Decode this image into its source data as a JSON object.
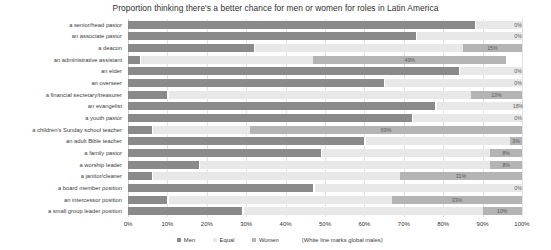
{
  "chart_data": {
    "type": "bar",
    "title": "Proportion thinking there's a better chance for men or women for roles in Latin America",
    "xlabel": "",
    "ylabel": "",
    "xlim": [
      0,
      100
    ],
    "grid": true,
    "stacked": true,
    "orientation": "horizontal",
    "legend_position": "bottom",
    "xticks": [
      "0%",
      "10%",
      "20%",
      "30%",
      "40%",
      "50%",
      "60%",
      "70%",
      "80%",
      "90%",
      "100%"
    ],
    "xtick_values": [
      0,
      10,
      20,
      30,
      40,
      50,
      60,
      70,
      80,
      90,
      100
    ],
    "legend": [
      {
        "name": "Men",
        "color": "#8a8a8a"
      },
      {
        "name": "Equal",
        "color": "#e8e8e8"
      },
      {
        "name": "Women",
        "color": "#b4b4b4"
      }
    ],
    "legend_note": "(White line marks global males)",
    "categories": [
      "a senior/head pastor",
      "an associate pastor",
      "a deacon",
      "an administrative assistant",
      "an elder",
      "an overseer",
      "a financial secretary/treasurer",
      "an evangelist",
      "a youth pastor",
      "a children's Sunday school teacher",
      "an adult Bible teacher",
      "a family pastor",
      "a worship leader",
      "a janitor/cleaner",
      "a board member position",
      "an intercessor position",
      "a small group leader position"
    ],
    "series": [
      {
        "name": "Men",
        "color": "#8a8a8a",
        "values": [
          88,
          73,
          32,
          3,
          84,
          65,
          10,
          78,
          72,
          6,
          60,
          49,
          18,
          6,
          47,
          10,
          29
        ]
      },
      {
        "name": "Equal",
        "color": "#e8e8e8",
        "values": [
          12,
          27,
          53,
          44,
          16,
          35,
          77,
          22,
          28,
          25,
          37,
          43,
          74,
          63,
          53,
          57,
          61
        ]
      },
      {
        "name": "Women",
        "color": "#b4b4b4",
        "values": [
          0,
          0,
          15,
          49,
          0,
          0,
          13,
          0,
          0,
          69,
          3,
          8,
          8,
          31,
          0,
          33,
          10
        ]
      }
    ],
    "value_labels": [
      {
        "category": "a senior/head pastor",
        "label": "0%",
        "series": "Women",
        "value": 0
      },
      {
        "category": "an associate pastor",
        "label": "0%",
        "series": "Women",
        "value": 0
      },
      {
        "category": "a deacon",
        "label": "15%",
        "series": "Women",
        "value": 15
      },
      {
        "category": "an administrative assistant",
        "label": "49%",
        "series": "Women",
        "value": 49
      },
      {
        "category": "an elder",
        "label": "0%",
        "series": "Women",
        "value": 0
      },
      {
        "category": "an overseer",
        "label": "0%",
        "series": "Women",
        "value": 0
      },
      {
        "category": "a financial secretary/treasurer",
        "label": "13%",
        "series": "Women",
        "value": 13
      },
      {
        "category": "an evangelist",
        "label": "18%",
        "series": "Women",
        "value": 18
      },
      {
        "category": "a youth pastor",
        "label": "0%",
        "series": "Women",
        "value": 0
      },
      {
        "category": "a children's Sunday school teacher",
        "label": "69%",
        "series": "Women",
        "value": 69
      },
      {
        "category": "an adult Bible teacher",
        "label": "3%",
        "series": "Women",
        "value": 3
      },
      {
        "category": "a family pastor",
        "label": "8%",
        "series": "Women",
        "value": 8
      },
      {
        "category": "a worship leader",
        "label": "8%",
        "series": "Women",
        "value": 8
      },
      {
        "category": "a janitor/cleaner",
        "label": "31%",
        "series": "Women",
        "value": 31
      },
      {
        "category": "a board member position",
        "label": "0%",
        "series": "Women",
        "value": 0
      },
      {
        "category": "an intercessor position",
        "label": "33%",
        "series": "Women",
        "value": 33
      },
      {
        "category": "a small group leader position",
        "label": "10%",
        "series": "Women",
        "value": 10
      }
    ],
    "global_male_markers": [
      88,
      73,
      32,
      3,
      84,
      65,
      10,
      78,
      72,
      6,
      60,
      49,
      18,
      6,
      47,
      10,
      29
    ]
  }
}
